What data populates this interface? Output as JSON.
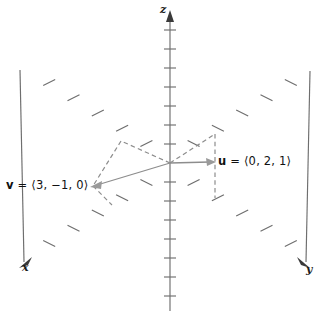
{
  "figure": {
    "type": "3d-coordinate-axes-vector-diagram",
    "background_color": "#ffffff",
    "axis_color": "#6e6e6e",
    "vector_color": "#8d8d8d",
    "text_color": "#111111",
    "origin": {
      "x": 170,
      "y": 163
    }
  },
  "axes": [
    {
      "name": "x-axis",
      "label": "x",
      "label_position": "lower-left",
      "arrow_at": "lower-left",
      "tick_count_positive": 5,
      "tick_count_negative": 5
    },
    {
      "name": "y-axis",
      "label": "y",
      "label_position": "lower-right",
      "arrow_at": "lower-right",
      "tick_count_positive": 5,
      "tick_count_negative": 5
    },
    {
      "name": "z-axis",
      "label": "z",
      "label_position": "top",
      "arrow_at": "top",
      "tick_count_positive": 7,
      "tick_count_negative": 7
    }
  ],
  "vectors": [
    {
      "name": "u",
      "label": "u = ⟨0, 2, 1⟩",
      "symbol": "u",
      "components": [
        0,
        2,
        1
      ],
      "tip": {
        "x": 214,
        "y": 162
      },
      "has_dashed_projection": true
    },
    {
      "name": "v",
      "label": "v = ⟨3, −1, 0⟩",
      "symbol": "v",
      "components": [
        3,
        -1,
        0
      ],
      "tip": {
        "x": 92,
        "y": 186
      },
      "has_dashed_projection": true
    }
  ],
  "bottom_text": ""
}
